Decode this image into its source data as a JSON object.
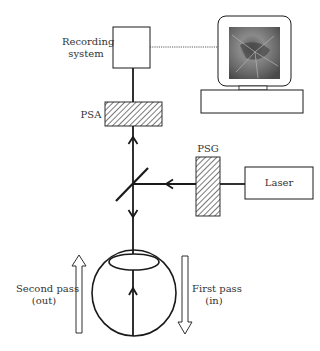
{
  "diagram": {
    "components": {
      "recording_system": "Recording system",
      "recording_line1": "Recording",
      "recording_line2": "system",
      "psa": "PSA",
      "psg": "PSG",
      "laser": "Laser"
    },
    "passes": {
      "second_line1": "Second pass",
      "second_line2": "(out)",
      "first_line1": "First pass",
      "first_line2": "(in)"
    },
    "colors": {
      "stroke": "#1a1a1a",
      "text": "#333333",
      "screen": "#6b6b6b"
    }
  }
}
